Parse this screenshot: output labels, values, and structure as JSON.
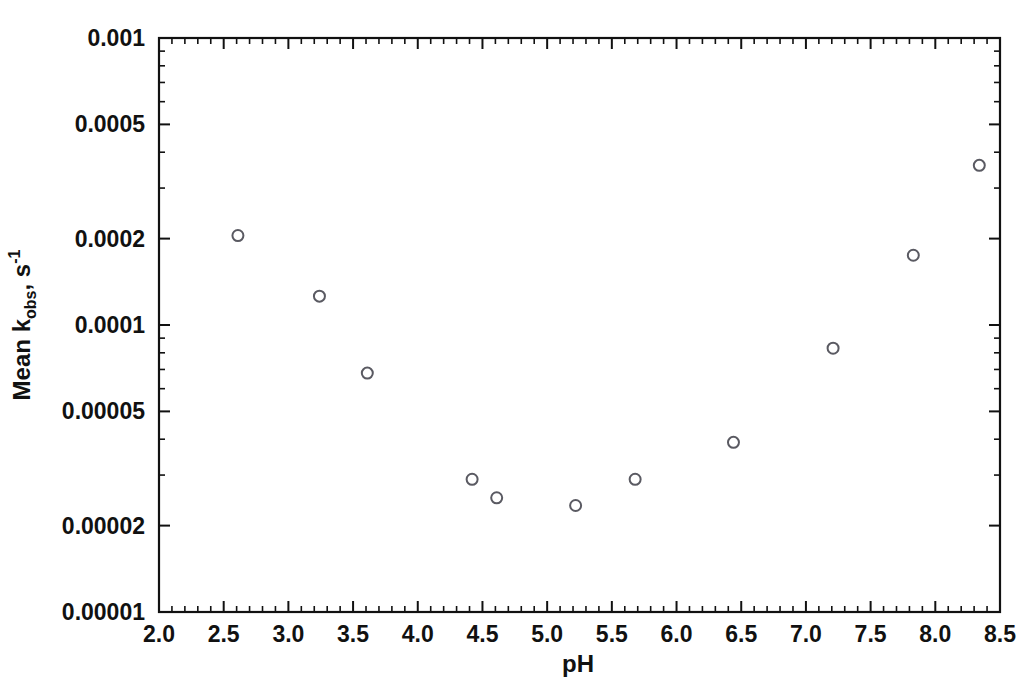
{
  "chart_data": {
    "type": "scatter",
    "title": "",
    "xlabel": "pH",
    "ylabel_parts": {
      "prefix": "Mean k",
      "subscript": "obs",
      "middle": ", s",
      "superscript": "-1"
    },
    "ylabel": "Mean kobs, s-1",
    "xlim": [
      2.0,
      8.5
    ],
    "ylim": [
      1e-05,
      0.001
    ],
    "yscale": "log",
    "xscale": "linear",
    "grid": false,
    "legend": null,
    "xticks": [
      2.0,
      2.5,
      3.0,
      3.5,
      4.0,
      4.5,
      5.0,
      5.5,
      6.0,
      6.5,
      7.0,
      7.5,
      8.0,
      8.5
    ],
    "xtick_labels": [
      "2.0",
      "2.5",
      "3.0",
      "3.5",
      "4.0",
      "4.5",
      "5.0",
      "5.5",
      "6.0",
      "6.5",
      "7.0",
      "7.5",
      "8.0",
      "8.5"
    ],
    "yticks": [
      1e-05,
      2e-05,
      5e-05,
      0.0001,
      0.0002,
      0.0005,
      0.001
    ],
    "ytick_labels": [
      "0.00001",
      "0.00002",
      "0.00005",
      "0.0001",
      "0.0002",
      "0.0005",
      "0.001"
    ],
    "x_minor_step": 0.1,
    "marker": "open-circle",
    "marker_size": 11,
    "marker_color": "#5a5a62",
    "axis_color": "#111111",
    "background_color": "#ffffff",
    "series": [
      {
        "name": "Mean kobs",
        "points": [
          {
            "x": 2.61,
            "y": 0.000205
          },
          {
            "x": 3.24,
            "y": 0.000126
          },
          {
            "x": 3.61,
            "y": 6.8e-05
          },
          {
            "x": 4.42,
            "y": 2.9e-05
          },
          {
            "x": 4.61,
            "y": 2.5e-05
          },
          {
            "x": 5.22,
            "y": 2.35e-05
          },
          {
            "x": 5.68,
            "y": 2.9e-05
          },
          {
            "x": 6.44,
            "y": 3.9e-05
          },
          {
            "x": 7.21,
            "y": 8.3e-05
          },
          {
            "x": 7.83,
            "y": 0.000175
          },
          {
            "x": 8.34,
            "y": 0.00036
          }
        ]
      }
    ]
  },
  "plot_geometry": {
    "left": 159,
    "right": 1000,
    "top": 38,
    "bottom": 612
  }
}
